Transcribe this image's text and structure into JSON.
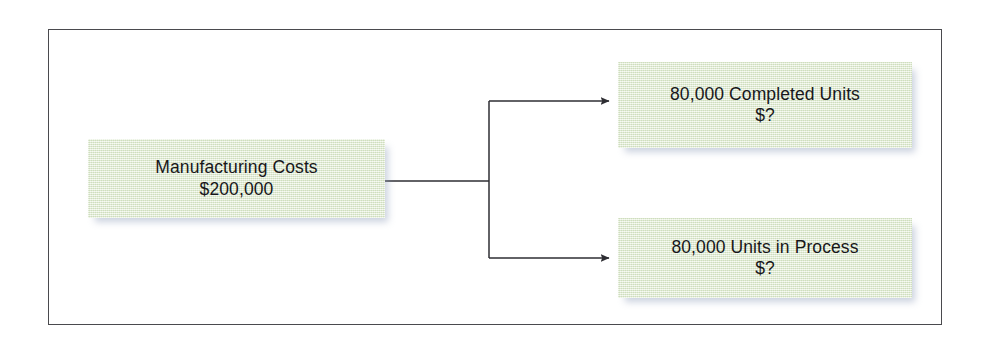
{
  "diagram": {
    "frame_border_color": "#4a4a4e",
    "box_fill_color": "#dfeace",
    "text_color": "#17171a",
    "connector_color": "#2e2e33",
    "background_color": "#ffffff",
    "source": {
      "label_line1": "Manufacturing Costs",
      "label_line2": "$200,000"
    },
    "outputs": [
      {
        "label_line1": "80,000 Completed Units",
        "label_line2": "$?"
      },
      {
        "label_line1": "80,000 Units in Process",
        "label_line2": "$?"
      }
    ],
    "connector": {
      "type": "fork",
      "arrowhead": "solid-triangle",
      "branch_count": 2
    }
  }
}
